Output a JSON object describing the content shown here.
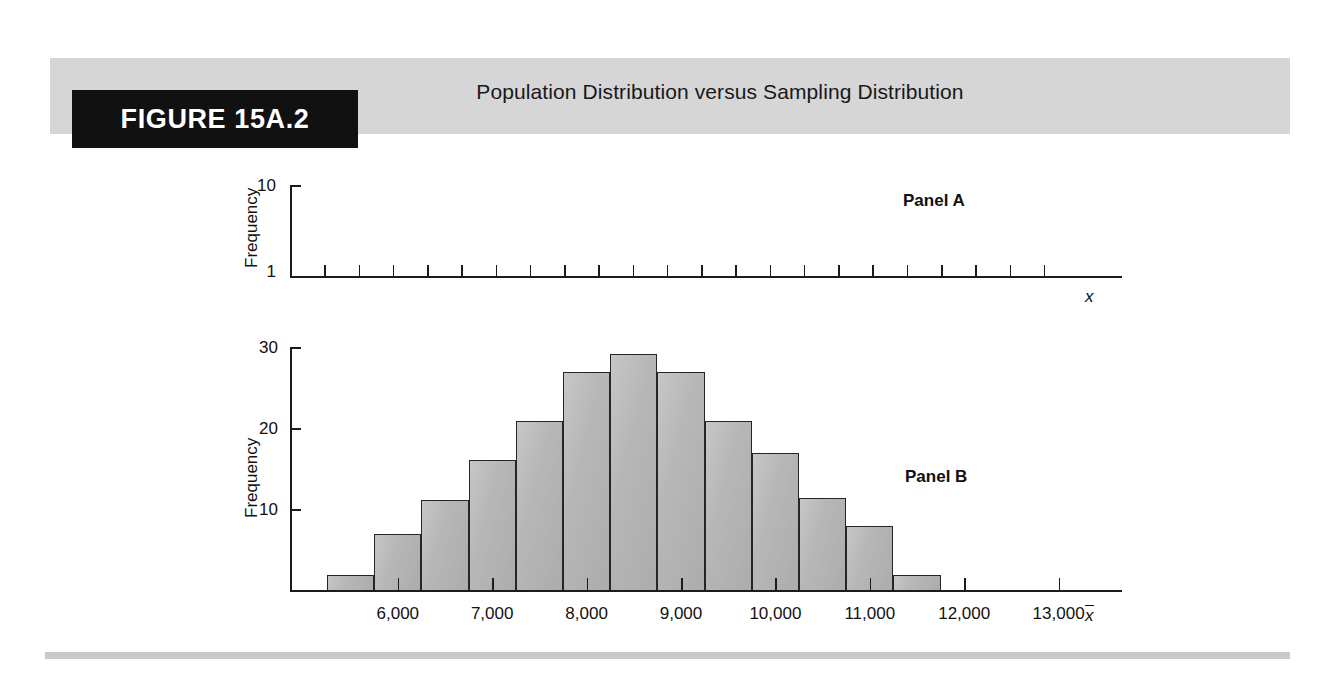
{
  "figure": {
    "tag": "FIGURE 15A.2",
    "title": "Population Distribution versus Sampling Distribution"
  },
  "colors": {
    "banner": "#d6d6d6",
    "tag_background": "#111111",
    "tag_text": "#ffffff",
    "bar_fill": "#b7b7b7",
    "bar_stroke": "#262626",
    "axis": "#1b1b1b",
    "footer_rule": "#c9c9c9"
  },
  "panel_a": {
    "label": "Panel A",
    "ylabel": "Frequency",
    "ytick_top": "10",
    "ytick_bottom": "1",
    "xlabel": "x"
  },
  "panel_b": {
    "label": "Panel B",
    "ylabel": "Frequency",
    "yticks": [
      "30",
      "20",
      "10"
    ],
    "xticks": [
      "6,000",
      "7,000",
      "8,000",
      "9,000",
      "10,000",
      "11,000",
      "12,000",
      "13,000"
    ],
    "xlabel": "x"
  },
  "chart_data": [
    {
      "type": "bar",
      "title": "Panel A — Population Distribution",
      "xlabel": "x",
      "ylabel": "Frequency",
      "ylim": [
        1,
        10
      ],
      "ytick_labels": [
        "1",
        "10"
      ],
      "grid": false,
      "legend": "none",
      "categories": [],
      "values": [],
      "note": "Empty plot frame: flat baseline with 22 evenly spaced x-axis tick marks and no bars drawn."
    },
    {
      "type": "bar",
      "title": "Panel B — Sampling Distribution",
      "xlabel": "x",
      "ylabel": "Frequency",
      "ylim": [
        0,
        31
      ],
      "ytick_values": [
        10,
        20,
        30
      ],
      "ytick_labels": [
        "10",
        "20",
        "30"
      ],
      "xtick_values": [
        6000,
        7000,
        8000,
        9000,
        10000,
        11000,
        12000,
        13000
      ],
      "xtick_labels": [
        "6,000",
        "7,000",
        "8,000",
        "9,000",
        "10,000",
        "11,000",
        "12,000",
        "13,000"
      ],
      "grid": false,
      "legend": "none",
      "bin_width": 500,
      "bin_centers": [
        5500,
        6000,
        6500,
        7000,
        7500,
        8000,
        8500,
        9000,
        9500,
        10000,
        10500,
        11000,
        11500,
        12000,
        12500
      ],
      "categories": [
        "5500",
        "6000",
        "6500",
        "7000",
        "7500",
        "8000",
        "8500",
        "9000",
        "9500",
        "10000",
        "10500",
        "11000",
        "11500",
        "12000",
        "12500"
      ],
      "values": [
        2,
        7,
        11.3,
        16.2,
        21,
        27,
        29.3,
        27,
        21,
        17,
        11.5,
        8,
        2,
        0,
        0
      ]
    }
  ]
}
